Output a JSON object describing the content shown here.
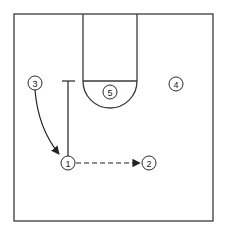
{
  "diagram": {
    "type": "basketball-half-court-play",
    "colors": {
      "line": "#3a3a3a",
      "background": "#ffffff"
    },
    "court": {
      "boundary": {
        "x1": 14,
        "y1": 14,
        "x2": 213,
        "y2": 221
      },
      "lane": {
        "x1": 83,
        "x2": 137,
        "y_top": 14,
        "free_throw_y": 81
      },
      "free_throw_arc": {
        "cx": 110,
        "cy": 81,
        "r": 27
      }
    },
    "players": [
      {
        "id": "1",
        "label": "1",
        "x": 68,
        "y": 163
      },
      {
        "id": "2",
        "label": "2",
        "x": 149,
        "y": 163
      },
      {
        "id": "3",
        "label": "3",
        "x": 35,
        "y": 83
      },
      {
        "id": "4",
        "label": "4",
        "x": 176,
        "y": 84
      },
      {
        "id": "5",
        "label": "5",
        "x": 110,
        "y": 92
      }
    ],
    "actions": [
      {
        "type": "cut",
        "from": "3",
        "to": "1",
        "style": "solid-curved-arrow"
      },
      {
        "type": "pass",
        "from": "1",
        "to": "2",
        "style": "dashed-arrow"
      },
      {
        "type": "screen",
        "by": "1",
        "style": "solid-line-with-bar"
      }
    ]
  }
}
